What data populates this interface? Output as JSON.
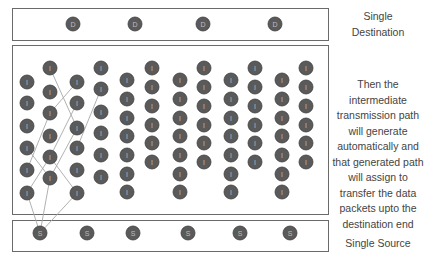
{
  "diagram": {
    "colors": {
      "node_fill": "#5a5a5a",
      "node_stroke": "#3e3e3e",
      "node_text": "#bdbdbd",
      "box_border": "#6a6a6a",
      "path_line": "#a8a8a8",
      "label_text": "#444444"
    },
    "destination": {
      "label": "Single Destination",
      "label_lines": [
        "Single",
        "Destination"
      ],
      "node_glyph": "D",
      "nodes": [
        [
          73,
          24
        ],
        [
          135,
          24
        ],
        [
          203,
          24
        ],
        [
          275,
          24
        ]
      ]
    },
    "intermediate": {
      "node_glyph": "I",
      "description_lines": [
        "Then the",
        "intermediate",
        "transmission path",
        "will generate",
        "automatically and",
        "that generated path",
        "will assign to",
        "transfer the data",
        "packets upto the",
        "destination end"
      ],
      "columns": [
        {
          "x": 27,
          "ys": [
            82,
            103,
            126,
            148,
            170,
            193
          ]
        },
        {
          "x": 50,
          "ys": [
            68,
            92,
            113,
            136,
            157,
            178
          ]
        },
        {
          "x": 77,
          "ys": [
            82,
            103,
            128,
            148,
            170,
            193
          ]
        },
        {
          "x": 101,
          "ys": [
            68,
            89,
            112,
            133,
            155,
            177
          ]
        },
        {
          "x": 127,
          "ys": [
            80,
            99,
            118,
            136,
            155,
            174,
            192
          ]
        },
        {
          "x": 152,
          "ys": [
            68,
            87,
            106,
            125,
            143,
            162
          ]
        },
        {
          "x": 180,
          "ys": [
            80,
            99,
            118,
            136,
            155,
            174,
            192
          ]
        },
        {
          "x": 204,
          "ys": [
            68,
            87,
            106,
            125,
            143,
            162
          ]
        },
        {
          "x": 231,
          "ys": [
            80,
            99,
            118,
            136,
            155,
            174,
            192
          ]
        },
        {
          "x": 255,
          "ys": [
            68,
            87,
            106,
            125,
            143,
            162
          ]
        },
        {
          "x": 282,
          "ys": [
            80,
            99,
            118,
            136,
            155,
            174,
            192
          ]
        },
        {
          "x": 306,
          "ys": [
            68,
            87,
            106,
            125,
            143,
            162
          ]
        }
      ]
    },
    "source": {
      "label": "Single Source",
      "node_glyph": "S",
      "nodes": [
        [
          40,
          233
        ],
        [
          87,
          233
        ],
        [
          133,
          233
        ],
        [
          188,
          233
        ],
        [
          240,
          233
        ],
        [
          290,
          233
        ]
      ]
    },
    "paths": [
      [
        [
          40,
          233
        ],
        [
          27,
          193
        ]
      ],
      [
        [
          40,
          233
        ],
        [
          50,
          178
        ]
      ],
      [
        [
          40,
          233
        ],
        [
          77,
          193
        ]
      ],
      [
        [
          27,
          193
        ],
        [
          50,
          157
        ]
      ],
      [
        [
          77,
          193
        ],
        [
          50,
          157
        ]
      ],
      [
        [
          27,
          148
        ],
        [
          50,
          178
        ]
      ],
      [
        [
          50,
          157
        ],
        [
          77,
          103
        ]
      ],
      [
        [
          27,
          170
        ],
        [
          50,
          113
        ]
      ],
      [
        [
          50,
          113
        ],
        [
          77,
          82
        ]
      ],
      [
        [
          50,
          68
        ],
        [
          77,
          128
        ]
      ],
      [
        [
          77,
          148
        ],
        [
          101,
          89
        ]
      ],
      [
        [
          77,
          128
        ],
        [
          50,
          178
        ]
      ]
    ]
  }
}
